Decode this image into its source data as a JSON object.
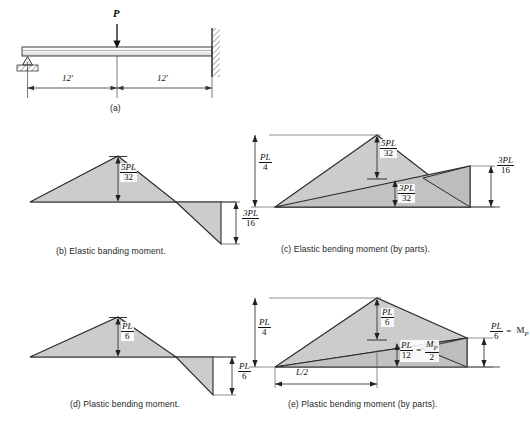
{
  "figure": {
    "title_panels": [
      "(a)",
      "(b)",
      "(c)",
      "(d)",
      "(e)"
    ],
    "colors": {
      "line": "#222222",
      "fill": "#cccccc",
      "fill_dark": "#bdbdbd",
      "hatch": "#555555",
      "background": "#ffffff"
    }
  },
  "panel_a": {
    "caption": "(a)",
    "load_label": "P",
    "dim_left": "12'",
    "dim_right": "12'",
    "support_left": "pin-support",
    "support_right": "fixed-wall"
  },
  "panel_b": {
    "caption": "(b) Elastic banding moment.",
    "labels": [
      {
        "num": "5PL",
        "den": "32",
        "name": "moment-positive-5PL-32"
      },
      {
        "num": "3PL",
        "den": "16",
        "name": "moment-negative-3PL-16"
      }
    ]
  },
  "panel_c": {
    "caption": "(c) Elastic bending moment (by parts).",
    "labels": [
      {
        "num": "PL",
        "den": "4",
        "name": "ordinate-PL-4"
      },
      {
        "num": "5PL",
        "den": "32",
        "name": "ordinate-5PL-32"
      },
      {
        "num": "3PL",
        "den": "32",
        "name": "ordinate-3PL-32"
      },
      {
        "num": "3PL",
        "den": "16",
        "name": "ordinate-3PL-16"
      }
    ]
  },
  "panel_d": {
    "caption": "(d) Plastic bending moment.",
    "labels": [
      {
        "num": "PL",
        "den": "6",
        "name": "moment-positive-PL-6"
      },
      {
        "num": "PL",
        "den": "6",
        "name": "moment-negative-PL-6"
      }
    ]
  },
  "panel_e": {
    "caption": "(e) Plastic bending moment (by parts).",
    "labels": [
      {
        "num": "PL",
        "den": "4",
        "name": "ordinate-PL-4"
      },
      {
        "num": "PL",
        "den": "6",
        "name": "ordinate-PL-6"
      },
      {
        "num": "PL",
        "den": "12",
        "den2": "2",
        "num2": "M",
        "sub2": "P",
        "eq": "=",
        "name": "ordinate-PL-12-eq-MP-2"
      },
      {
        "num": "PL",
        "den": "6",
        "num2": "M",
        "sub2": "P",
        "eq": "=",
        "name": "ordinate-PL-6-eq-MP"
      }
    ],
    "span_label": "L/2"
  }
}
